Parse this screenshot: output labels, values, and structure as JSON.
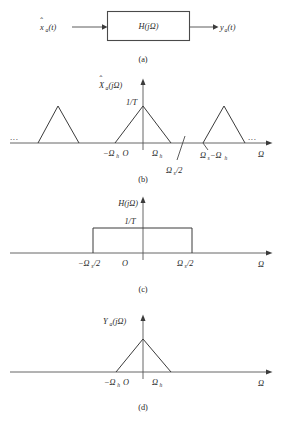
{
  "figure": {
    "title_visible": false,
    "background_color": "#ffffff",
    "line_color": "#3b3b3b",
    "axis_color": "#555555",
    "panels": [
      {
        "id": "a",
        "caption": "(a)",
        "kind": "block-diagram",
        "input_label": "x̂ₐ(t)",
        "input_base": "x",
        "input_sub": "a",
        "input_arg": "(t)",
        "block_label": "H(jΩ)",
        "output_label": "yₐ(t)",
        "output_base": "y",
        "output_sub": "a",
        "output_arg": "(t)"
      },
      {
        "id": "b",
        "caption": "(b)",
        "kind": "spectrum-periodic",
        "y_label": "X̂ₐ(jΩ)",
        "y_label_base": "X",
        "y_label_sub": "a",
        "y_label_arg": "(jΩ)",
        "peak_label": "1/T",
        "x_axis_label": "Ω",
        "origin_label": "O",
        "tick_labels": [
          "−Ωₕ",
          "O",
          "Ωₕ",
          "Ωₛ−Ωₕ"
        ],
        "annotation_label": "Ωₛ/2",
        "ellipsis_left": "...",
        "ellipsis_right": "...",
        "replicas": 3
      },
      {
        "id": "c",
        "caption": "(c)",
        "kind": "filter-rect",
        "y_label": "H(jΩ)",
        "peak_label": "1/T",
        "x_axis_label": "Ω",
        "origin_label": "O",
        "left_edge_label": "−Ωₛ/2",
        "right_edge_label": "Ωₛ/2"
      },
      {
        "id": "d",
        "caption": "(d)",
        "kind": "spectrum-single",
        "y_label": "Yₐ(jΩ)",
        "y_label_base": "Y",
        "y_label_sub": "a",
        "y_label_arg": "(jΩ)",
        "x_axis_label": "Ω",
        "origin_label": "O",
        "left_tick_label": "−Ωₕ",
        "right_tick_label": "Ωₕ"
      }
    ],
    "symbols": {
      "omega": "Ω",
      "sub_h": "h",
      "sub_s": "s",
      "sub_a": "a",
      "one_over_T": "1/T",
      "hat_mark": "ˆ"
    }
  }
}
